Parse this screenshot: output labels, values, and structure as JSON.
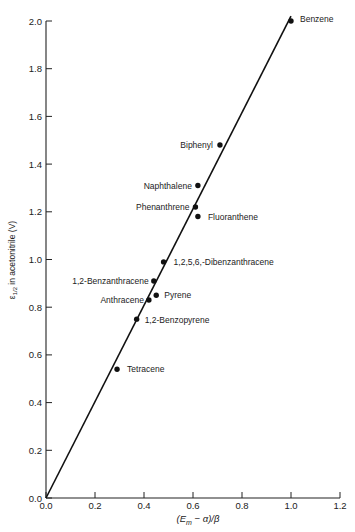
{
  "chart_data": {
    "type": "scatter",
    "title": "",
    "xlabel": "(E_m − α)/β",
    "ylabel": "ε1/2 in acetonitrile (V)",
    "xlim": [
      0.0,
      1.2
    ],
    "ylim": [
      0.0,
      2.0
    ],
    "grid": false,
    "legend": "none",
    "x_ticks": [
      "0.0",
      "0.2",
      "0.4",
      "0.6",
      "0.8",
      "1.0",
      "1.2"
    ],
    "y_ticks": [
      "0.0",
      "0.2",
      "0.4",
      "0.6",
      "0.8",
      "1.0",
      "1.2",
      "1.4",
      "1.6",
      "1.8",
      "2.0"
    ],
    "series": [
      {
        "name": "Aromatic hydrocarbons",
        "points": [
          {
            "label": "Benzene",
            "x": 1.0,
            "y": 2.0
          },
          {
            "label": "Biphenyl",
            "x": 0.71,
            "y": 1.48
          },
          {
            "label": "Naphthalene",
            "x": 0.62,
            "y": 1.31
          },
          {
            "label": "Phenanthrene",
            "x": 0.61,
            "y": 1.22
          },
          {
            "label": "Fluoranthene",
            "x": 0.62,
            "y": 1.18
          },
          {
            "label": "1,2,5,6,-Dibenzanthracene",
            "x": 0.48,
            "y": 0.99
          },
          {
            "label": "1,2-Benzanthracene",
            "x": 0.44,
            "y": 0.91
          },
          {
            "label": "Pyrene",
            "x": 0.45,
            "y": 0.85
          },
          {
            "label": "Anthracene",
            "x": 0.42,
            "y": 0.83
          },
          {
            "label": "1,2-Benzopyrene",
            "x": 0.37,
            "y": 0.75
          },
          {
            "label": "Tetracene",
            "x": 0.29,
            "y": 0.54
          }
        ]
      }
    ],
    "fit_line": {
      "x": [
        0.0,
        1.0
      ],
      "y": [
        0.0,
        2.02
      ]
    }
  },
  "labels": {
    "xlabel_main": "(E",
    "xlabel_sub": "m",
    "xlabel_rest": " − α)/β",
    "ylabel_eps": "ε",
    "ylabel_sub": "1/2",
    "ylabel_rest": " in acetonitrile (V)"
  }
}
